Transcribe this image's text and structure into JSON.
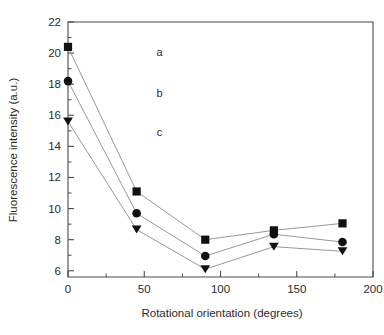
{
  "chart_data": {
    "type": "line",
    "title": "",
    "subtitle": "",
    "xlabel": "Rotational orientation (degrees)",
    "ylabel": "Fluorescence intensity (a.u.)",
    "x": [
      0,
      45,
      90,
      135,
      180
    ],
    "xlim": [
      0,
      200
    ],
    "ylim": [
      5.6,
      22
    ],
    "grid": false,
    "legend_position": "inline-curve-labels",
    "x_ticks_major": [
      0,
      50,
      100,
      150,
      200
    ],
    "x_tick_labels": [
      "0",
      "50",
      "100",
      "150",
      "200"
    ],
    "x_ticks_minor": [
      25,
      75,
      125,
      175
    ],
    "y_ticks_major": [
      6,
      8,
      10,
      12,
      14,
      16,
      18,
      20,
      22
    ],
    "y_tick_labels": [
      "6",
      "8",
      "10",
      "12",
      "14",
      "16",
      "18",
      "20",
      "22"
    ],
    "y_ticks_minor": [
      7,
      9,
      11,
      13,
      15,
      17,
      19,
      21
    ],
    "series": [
      {
        "name": "a",
        "marker": "square",
        "values": [
          20.4,
          11.1,
          8.0,
          8.6,
          9.05
        ],
        "label_x": 60,
        "label_y": 19.8
      },
      {
        "name": "b",
        "marker": "circle",
        "values": [
          18.2,
          9.7,
          6.95,
          8.35,
          7.85
        ],
        "label_x": 60,
        "label_y": 17.2
      },
      {
        "name": "c",
        "marker": "triangle-down",
        "values": [
          15.6,
          8.65,
          6.1,
          7.55,
          7.25
        ],
        "label_x": 60,
        "label_y": 14.7
      }
    ],
    "colors": {
      "marker": "#111111",
      "line": "#8c8c8c",
      "axis": "#4a4a4a",
      "text": "#2b2b2b",
      "background": "#ffffff"
    }
  }
}
